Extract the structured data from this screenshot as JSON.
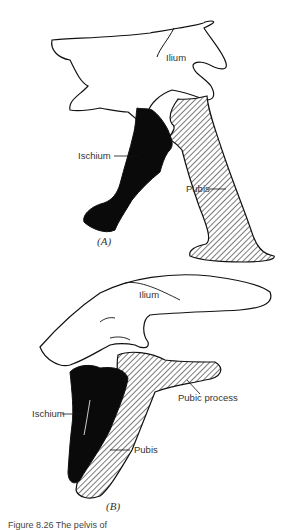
{
  "figure": {
    "panels": [
      {
        "id": "A",
        "label": "(A)",
        "parts": {
          "ilium": "Ilium",
          "ischium": "Ischium",
          "pubis": "Pubis"
        }
      },
      {
        "id": "B",
        "label": "(B)",
        "parts": {
          "ilium": "Ilium",
          "ischium": "Ischium",
          "pubis": "Pubis",
          "pubic_process": "Pubic process"
        }
      }
    ],
    "caption": "Figure 8.26   The pelvis of"
  },
  "colors": {
    "ink": "#111111",
    "fill_ischium": "#0a0a0a",
    "hatch": "#333333",
    "background": "#ffffff"
  }
}
